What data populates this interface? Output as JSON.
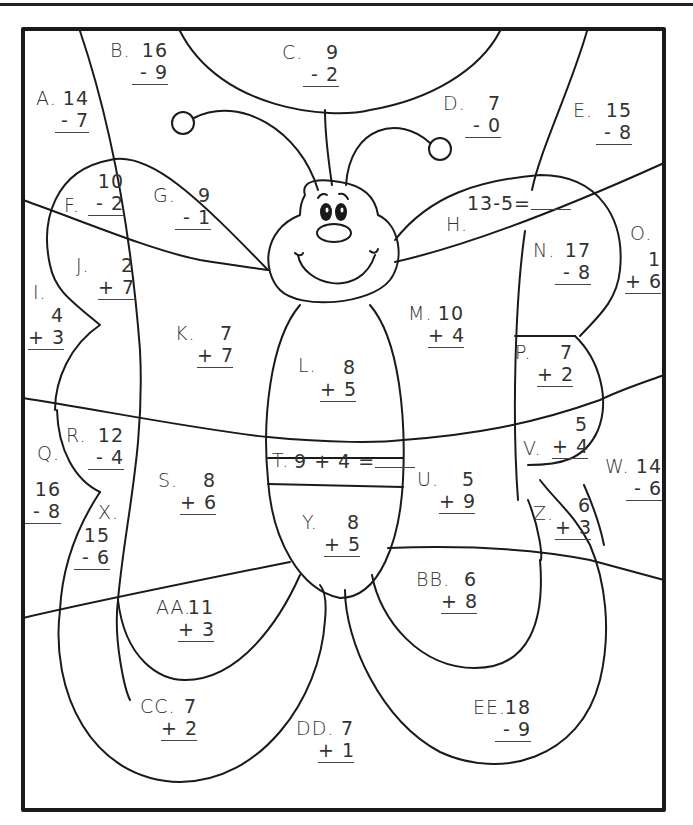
{
  "worksheet": {
    "title": "Color by number butterfly addition and subtraction",
    "colors": {
      "line": "#1a1a1a",
      "text": "#333333",
      "background": "#ffffff"
    },
    "problems": [
      {
        "id": "A",
        "label": "A.",
        "top": "14",
        "bottom": "- 7"
      },
      {
        "id": "B",
        "label": "B.",
        "top": "16",
        "bottom": "- 9"
      },
      {
        "id": "C",
        "label": "C.",
        "top": "9",
        "bottom": "- 2"
      },
      {
        "id": "D",
        "label": "D.",
        "top": "7",
        "bottom": "- 0"
      },
      {
        "id": "E",
        "label": "E.",
        "top": "15",
        "bottom": "- 8"
      },
      {
        "id": "F",
        "label": "F.",
        "top": "10",
        "bottom": "- 2"
      },
      {
        "id": "G",
        "label": "G.",
        "top": "9",
        "bottom": "- 1"
      },
      {
        "id": "H",
        "label": "H.",
        "equation": "13-5="
      },
      {
        "id": "I",
        "label": "I.",
        "top": "4",
        "bottom": "+ 3"
      },
      {
        "id": "J",
        "label": "J.",
        "top": "2",
        "bottom": "+ 7"
      },
      {
        "id": "K",
        "label": "K.",
        "top": "7",
        "bottom": "+ 7"
      },
      {
        "id": "L",
        "label": "L.",
        "top": "8",
        "bottom": "+ 5"
      },
      {
        "id": "M",
        "label": "M.",
        "top": "10",
        "bottom": "+ 4"
      },
      {
        "id": "N",
        "label": "N.",
        "top": "17",
        "bottom": "- 8"
      },
      {
        "id": "O",
        "label": "O.",
        "top": "1",
        "bottom": "+ 6"
      },
      {
        "id": "P",
        "label": "P.",
        "top": "7",
        "bottom": "+ 2"
      },
      {
        "id": "Q",
        "label": "Q.",
        "top": "16",
        "bottom": "- 8"
      },
      {
        "id": "R",
        "label": "R.",
        "top": "12",
        "bottom": "- 4"
      },
      {
        "id": "S",
        "label": "S.",
        "top": "8",
        "bottom": "+ 6"
      },
      {
        "id": "T",
        "label": "T.",
        "equation": "9 + 4 ="
      },
      {
        "id": "U",
        "label": "U.",
        "top": "5",
        "bottom": "+ 9"
      },
      {
        "id": "V",
        "label": "V.",
        "top": "5",
        "bottom": "+ 4"
      },
      {
        "id": "W",
        "label": "W.",
        "top": "14",
        "bottom": "- 6"
      },
      {
        "id": "X",
        "label": "X.",
        "top": "15",
        "bottom": "- 6"
      },
      {
        "id": "Y",
        "label": "Y.",
        "top": "8",
        "bottom": "+ 5"
      },
      {
        "id": "Z",
        "label": "Z.",
        "top": "6",
        "bottom": "+ 3"
      },
      {
        "id": "AA",
        "label": "AA.",
        "top": "11",
        "bottom": "+ 3"
      },
      {
        "id": "BB",
        "label": "BB.",
        "top": "6",
        "bottom": "+ 8"
      },
      {
        "id": "CC",
        "label": "CC.",
        "top": "7",
        "bottom": "+ 2"
      },
      {
        "id": "DD",
        "label": "DD.",
        "top": "7",
        "bottom": "+ 1"
      },
      {
        "id": "EE",
        "label": "EE.",
        "top": "18",
        "bottom": "- 9"
      }
    ]
  }
}
